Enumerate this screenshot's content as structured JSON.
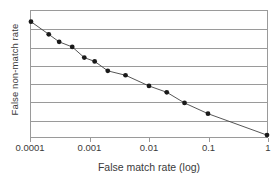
{
  "chart_data": {
    "type": "line",
    "title": "",
    "xlabel": "False match rate (log)",
    "ylabel": "False non-match rate",
    "xscale": "log",
    "xlim": [
      0.0001,
      1
    ],
    "ylim": [
      0,
      1
    ],
    "grid": true,
    "gridline_count": 6,
    "legend": null,
    "marker": "filled-circle",
    "series": [
      {
        "name": "DET curve",
        "x": [
          0.0001,
          0.0002,
          0.0003,
          0.0005,
          0.0008,
          0.0012,
          0.002,
          0.004,
          0.01,
          0.02,
          0.04,
          0.1,
          1
        ],
        "y": [
          0.915,
          0.815,
          0.755,
          0.715,
          0.63,
          0.6,
          0.525,
          0.49,
          0.405,
          0.355,
          0.27,
          0.185,
          0.015
        ]
      }
    ],
    "xticks": [
      {
        "value": 0.0001,
        "label": "0.0001"
      },
      {
        "value": 0.001,
        "label": "0.001"
      },
      {
        "value": 0.01,
        "label": "0.01"
      },
      {
        "value": 0.1,
        "label": "0.1"
      },
      {
        "value": 1,
        "label": "1"
      }
    ]
  },
  "colors": {
    "line": "#404040",
    "marker": "#1a1a1a",
    "grid": "#9a9a9a",
    "frame": "#9a9a9a",
    "text": "#3a3a3a",
    "background": "#ffffff"
  }
}
